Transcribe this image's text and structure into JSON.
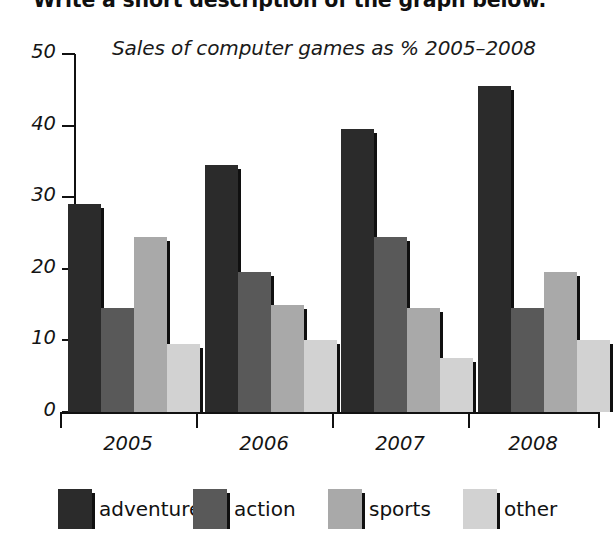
{
  "instruction": "Write a short description of the graph below.",
  "chart_data": {
    "type": "bar",
    "title": "Sales of computer games as % 2005–2008",
    "xlabel": "",
    "ylabel": "",
    "ylim": [
      0,
      50
    ],
    "ytick_labels": [
      "0",
      "10",
      "20",
      "30",
      "40",
      "50"
    ],
    "ytick_values": [
      0,
      10,
      20,
      30,
      40,
      50
    ],
    "grid": false,
    "legend_position": "bottom",
    "categories": [
      "2005",
      "2006",
      "2007",
      "2008"
    ],
    "series": [
      {
        "name": "adventure",
        "color": "#2b2b2b",
        "values": [
          29,
          34.5,
          39.5,
          45.5
        ]
      },
      {
        "name": "action",
        "color": "#595959",
        "values": [
          14.5,
          19.5,
          24.5,
          14.5
        ]
      },
      {
        "name": "sports",
        "color": "#a9a9a9",
        "values": [
          24.5,
          15,
          14.5,
          19.5
        ]
      },
      {
        "name": "other",
        "color": "#d2d2d2",
        "values": [
          9.5,
          10,
          7.5,
          10
        ]
      }
    ]
  }
}
